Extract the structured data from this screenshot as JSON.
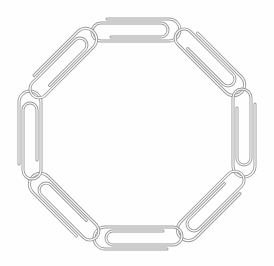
{
  "image": {
    "subject": "paperclip-chain-octagon",
    "clip_count": 8,
    "background_color": "#ffffff",
    "wire_color": "#9a9a9a",
    "wire_highlight": "#d8d8d8",
    "clips": [
      {
        "name": "top",
        "cx": 137,
        "cy": 30,
        "angle": 0
      },
      {
        "name": "top-right",
        "cx": 211,
        "cy": 62,
        "angle": 45
      },
      {
        "name": "right",
        "cx": 244,
        "cy": 134,
        "angle": 90
      },
      {
        "name": "bottom-right",
        "cx": 211,
        "cy": 207,
        "angle": 135
      },
      {
        "name": "bottom",
        "cx": 137,
        "cy": 238,
        "angle": 180
      },
      {
        "name": "bottom-left",
        "cx": 63,
        "cy": 207,
        "angle": 225
      },
      {
        "name": "left",
        "cx": 30,
        "cy": 134,
        "angle": 270
      },
      {
        "name": "top-left",
        "cx": 63,
        "cy": 62,
        "angle": 315
      }
    ]
  }
}
